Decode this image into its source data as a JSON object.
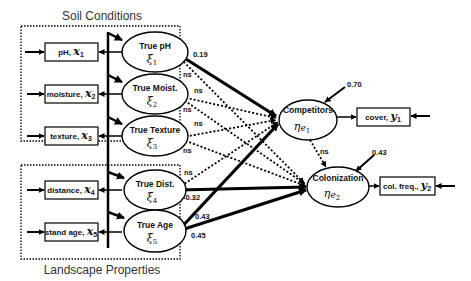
{
  "groups": {
    "soil": {
      "title": "Soil Conditions"
    },
    "landscape": {
      "title": "Landscape Properties"
    }
  },
  "indicators": {
    "x1": {
      "label": "pH, ",
      "var": "x",
      "sub": "1"
    },
    "x2": {
      "label": "moisture, ",
      "var": "x",
      "sub": "2"
    },
    "x3": {
      "label": "texture, ",
      "var": "x",
      "sub": "3"
    },
    "x4": {
      "label": "distance, ",
      "var": "x",
      "sub": "4"
    },
    "x5": {
      "label": "stand age, ",
      "var": "x",
      "sub": "5"
    },
    "y1": {
      "label": "cover, ",
      "var": "y",
      "sub": "1"
    },
    "y2": {
      "label": "col. freq., ",
      "var": "y",
      "sub": "2"
    }
  },
  "latent_exogenous": {
    "xi1": {
      "label": "True pH",
      "symbol": "ξ",
      "sub": "1"
    },
    "xi2": {
      "label": "True Moist.",
      "symbol": "ξ",
      "sub": "2"
    },
    "xi3": {
      "label": "True Texture",
      "symbol": "ξ",
      "sub": "3"
    },
    "xi4": {
      "label": "True Dist.",
      "symbol": "ξ",
      "sub": "4"
    },
    "xi5": {
      "label": "True Age",
      "symbol": "ξ",
      "sub": "5"
    }
  },
  "latent_endogenous": {
    "eta1": {
      "label": "Competitors",
      "symbol": "η",
      "sub": "e",
      "subsub": "1"
    },
    "eta2": {
      "label": "Colonization",
      "symbol": "η",
      "sub": "e",
      "subsub": "2"
    }
  },
  "coefficients": {
    "ph_to_comp": "0.19",
    "ph_to_col": "ns",
    "moist_to_comp": "ns",
    "moist_to_col": "ns",
    "texture_to_comp": "ns",
    "texture_to_col": "ns",
    "dist_to_comp": "ns",
    "dist_to_col": "-0.32",
    "age_to_comp": "0.43",
    "age_to_col": "0.45",
    "comp_to_col": "ns",
    "comp_error": "0.70",
    "col_error": "0.43",
    "extra_ns_1": "ns",
    "extra_ns_2": "ns"
  }
}
